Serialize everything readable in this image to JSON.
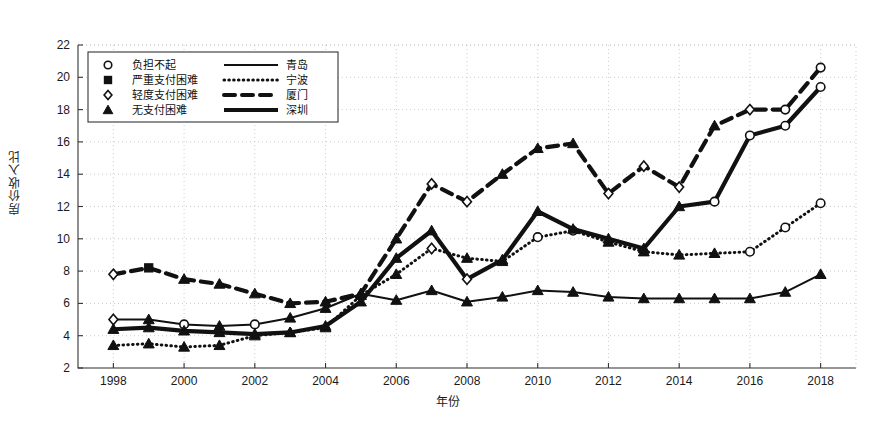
{
  "chart_data": {
    "type": "line",
    "title": "",
    "xlabel": "年份",
    "ylabel": "房价收入比",
    "xlim": [
      1997,
      2019
    ],
    "ylim": [
      2,
      22
    ],
    "ytick_step": 2,
    "xtick_step": 2,
    "grid": true,
    "grid_style": "dotted",
    "legend_position": "upper-left-inside",
    "x": [
      1998,
      1999,
      2000,
      2001,
      2002,
      2003,
      2004,
      2005,
      2006,
      2007,
      2008,
      2009,
      2010,
      2011,
      2012,
      2013,
      2014,
      2015,
      2016,
      2017,
      2018
    ],
    "xticklabels": [
      "1998",
      "2000",
      "2002",
      "2004",
      "2006",
      "2008",
      "2010",
      "2012",
      "2014",
      "2016",
      "2018"
    ],
    "yticklabels": [
      "2",
      "4",
      "6",
      "8",
      "10",
      "12",
      "14",
      "16",
      "18",
      "20",
      "22"
    ],
    "series": [
      {
        "name": "青岛",
        "line_style": "solid-thick",
        "values": [
          5.0,
          5.0,
          4.7,
          4.6,
          4.7,
          5.1,
          5.7,
          6.6,
          6.2,
          6.8,
          6.1,
          6.4,
          6.8,
          6.7,
          6.4,
          6.3,
          6.3,
          6.3,
          6.3,
          6.7,
          7.8
        ],
        "markers": [
          "diamond",
          "triangle",
          "circle",
          "triangle",
          "circle",
          "triangle",
          "triangle",
          "triangle",
          "triangle",
          "triangle",
          "triangle",
          "triangle",
          "triangle",
          "triangle",
          "triangle",
          "triangle",
          "triangle",
          "triangle",
          "triangle",
          "triangle",
          "triangle"
        ]
      },
      {
        "name": "宁波",
        "line_style": "dotted",
        "values": [
          3.4,
          3.5,
          3.3,
          3.4,
          4.0,
          4.2,
          4.5,
          6.5,
          7.8,
          9.4,
          8.8,
          8.6,
          10.1,
          10.5,
          9.8,
          9.2,
          9.0,
          9.1,
          9.2,
          10.7,
          12.2
        ],
        "markers": [
          "triangle",
          "triangle",
          "triangle",
          "triangle",
          "triangle",
          "triangle",
          "triangle",
          "triangle",
          "triangle",
          "diamond",
          "triangle",
          "triangle",
          "circle",
          "circle",
          "triangle",
          "triangle",
          "triangle",
          "triangle",
          "circle",
          "circle",
          "circle"
        ]
      },
      {
        "name": "厦门",
        "line_style": "dashed-thick",
        "values": [
          7.8,
          8.2,
          7.5,
          7.2,
          6.6,
          6.0,
          6.1,
          6.6,
          10.0,
          13.4,
          12.3,
          14.0,
          15.6,
          15.9,
          12.8,
          14.5,
          13.2,
          17.0,
          18.0,
          18.0,
          20.6
        ],
        "markers": [
          "diamond",
          "square",
          "triangle",
          "triangle",
          "triangle",
          "triangle",
          "triangle",
          "triangle",
          "triangle",
          "diamond",
          "diamond",
          "triangle",
          "triangle",
          "triangle",
          "diamond",
          "diamond",
          "diamond",
          "triangle",
          "diamond",
          "circle",
          "circle"
        ]
      },
      {
        "name": "深圳",
        "line_style": "solid-heavy",
        "values": [
          4.4,
          4.5,
          4.3,
          4.2,
          4.1,
          4.2,
          4.6,
          6.1,
          8.8,
          10.5,
          7.5,
          8.7,
          11.7,
          10.6,
          10.0,
          9.4,
          12.0,
          12.3,
          16.4,
          17.0,
          19.4
        ],
        "markers": [
          "triangle",
          "triangle",
          "triangle",
          "triangle",
          "triangle",
          "triangle",
          "triangle",
          "triangle",
          "triangle",
          "triangle",
          "diamond",
          "triangle",
          "triangle",
          "triangle",
          "triangle",
          "triangle",
          "triangle",
          "circle",
          "circle",
          "circle",
          "circle"
        ]
      }
    ]
  },
  "legend": {
    "marker_entries": [
      {
        "marker": "circle",
        "label": "负担不起"
      },
      {
        "marker": "square",
        "label": "严重支付困难"
      },
      {
        "marker": "diamond",
        "label": "轻度支付困难"
      },
      {
        "marker": "triangle",
        "label": "无支付困难"
      }
    ],
    "line_entries": [
      {
        "style": "solid-thick",
        "label": "青岛"
      },
      {
        "style": "dotted",
        "label": "宁波"
      },
      {
        "style": "dashed-thick",
        "label": "厦门"
      },
      {
        "style": "solid-heavy",
        "label": "深圳"
      }
    ]
  },
  "colors": {
    "ink": "#111111",
    "grid": "#bfbfbf",
    "axis": "#333333",
    "background": "#ffffff"
  }
}
